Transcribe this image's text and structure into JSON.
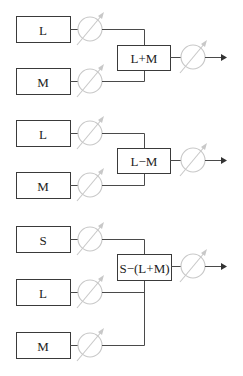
{
  "diagram": {
    "type": "block-diagram",
    "groups": [
      {
        "inputs": [
          "L",
          "M"
        ],
        "combiner": "L+M",
        "output": "arrow"
      },
      {
        "inputs": [
          "L",
          "M"
        ],
        "combiner": "L−M",
        "output": "arrow"
      },
      {
        "inputs": [
          "S",
          "L",
          "M"
        ],
        "combiner": "S−(L+M)",
        "output": "arrow"
      }
    ],
    "icons": {
      "gain": "variable-gain-icon",
      "output": "output-arrow-icon"
    },
    "colors": {
      "box_stroke": "#3a3a3a",
      "wire": "#4a4a4a",
      "gain_symbol": "#c8c8c8"
    }
  }
}
